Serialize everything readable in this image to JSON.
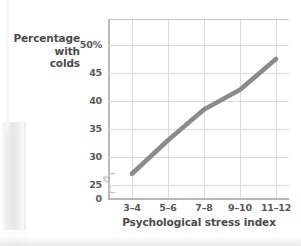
{
  "chart_data": {
    "type": "line",
    "title": "",
    "xlabel": "Psychological stress index",
    "ylabel": "Percentage with colds",
    "ylabel_lines": [
      "Percentage",
      "with",
      "colds"
    ],
    "categories": [
      "3–4",
      "5–6",
      "7–8",
      "9–10",
      "11–12"
    ],
    "series": [
      {
        "name": "Percentage with colds",
        "values": [
          27,
          33,
          38.5,
          42,
          47.5
        ],
        "color": "#8c8b8b"
      }
    ],
    "ylim": [
      25,
      50
    ],
    "y_ticks": [
      {
        "label": "50%",
        "value": 50
      },
      {
        "label": "45",
        "value": 45
      },
      {
        "label": "40",
        "value": 40
      },
      {
        "label": "35",
        "value": 35
      },
      {
        "label": "30",
        "value": 30
      },
      {
        "label": "25",
        "value": 25
      },
      {
        "label": "0",
        "value": 0
      }
    ],
    "y_axis_break": true,
    "y_axis_break_between": [
      0,
      25
    ],
    "grid": true,
    "legend": null,
    "legend_position": "none",
    "colors": {
      "line": "#8c8b8b",
      "grid": "#dcdbdb",
      "axis": "#b9b7b7",
      "text": "#58585a",
      "title_text": "#4b4b4d",
      "background": "#ffffff"
    }
  }
}
